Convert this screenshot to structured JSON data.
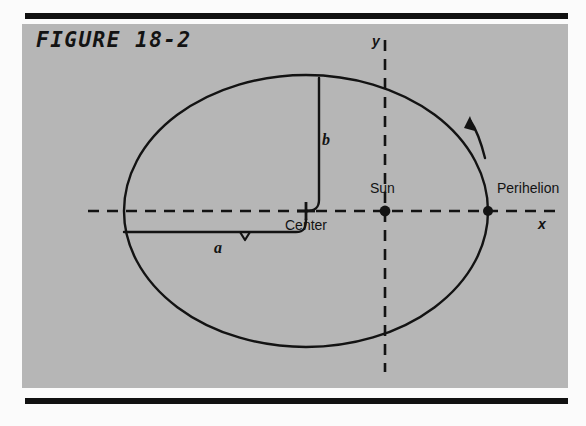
{
  "figure": {
    "title": "FIGURE 18-2",
    "panel_color": "#b6b6b6",
    "ink_color": "#131313",
    "page_color": "#fbfbfb"
  },
  "labels": {
    "sun": "Sun",
    "center": "Center",
    "perihelion": "Perihelion",
    "semi_major": "a",
    "semi_minor": "b",
    "axis_x": "x",
    "axis_y": "y"
  },
  "diagram": {
    "type": "orbit-ellipse",
    "ellipse": {
      "center_x": 306,
      "center_y": 211,
      "semi_major_px": 182,
      "semi_minor_px": 136
    },
    "points": [
      {
        "name": "center",
        "marker": "cross",
        "x": 306,
        "y": 211
      },
      {
        "name": "sun",
        "marker": "filled-dot",
        "x": 385,
        "y": 211
      },
      {
        "name": "perihelion",
        "marker": "filled-dot",
        "x": 488,
        "y": 211
      }
    ],
    "axes": [
      {
        "name": "x-axis",
        "style": "dashed",
        "orientation": "horizontal",
        "y": 211,
        "from_x": 88,
        "to_x": 556
      },
      {
        "name": "y-axis",
        "style": "dashed",
        "orientation": "vertical",
        "x": 385,
        "from_y": 40,
        "to_y": 372
      }
    ],
    "direction_arrow": {
      "name": "orbit-direction-arrow",
      "sense": "counterclockwise"
    }
  }
}
